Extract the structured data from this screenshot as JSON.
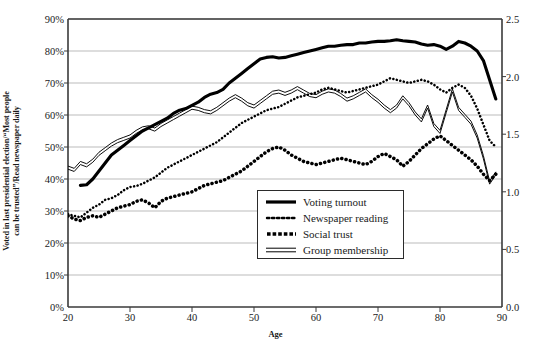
{
  "chart_data": {
    "type": "line",
    "title": "",
    "xlabel": "Age",
    "ylabel": "Voted in last presidential election/“Most people can be trusted”/Read newspaper daily",
    "ylabel_lines": [
      "Voted in last presidential election/“Most people",
      "can be trusted”/Read newspaper daily"
    ],
    "xlim": [
      20,
      90
    ],
    "ylim": [
      0,
      90
    ],
    "y2lim": [
      0.0,
      2.5
    ],
    "xticks": [
      20,
      30,
      40,
      50,
      60,
      70,
      80,
      90
    ],
    "xtick_labels": [
      "20",
      "30",
      "40",
      "50",
      "60",
      "70",
      "80",
      "90"
    ],
    "yticks": [
      0,
      10,
      20,
      30,
      40,
      50,
      60,
      70,
      80,
      90
    ],
    "ytick_labels": [
      "0%",
      "10%",
      "20%",
      "30%",
      "40%",
      "50%",
      "60%",
      "70%",
      "80%",
      "90%"
    ],
    "y2ticks": [
      0.0,
      0.5,
      1.0,
      1.5,
      2.0,
      2.5
    ],
    "y2tick_labels": [
      "0.0",
      "0.5",
      "1.0",
      "1.5",
      "2.0",
      "2.5"
    ],
    "grid": "horizontal",
    "legend_position": "center",
    "x": [
      20,
      21,
      22,
      23,
      24,
      25,
      26,
      27,
      28,
      29,
      30,
      31,
      32,
      33,
      34,
      35,
      36,
      37,
      38,
      39,
      40,
      41,
      42,
      43,
      44,
      45,
      46,
      47,
      48,
      49,
      50,
      51,
      52,
      53,
      54,
      55,
      56,
      57,
      58,
      59,
      60,
      61,
      62,
      63,
      64,
      65,
      66,
      67,
      68,
      69,
      70,
      71,
      72,
      73,
      74,
      75,
      76,
      77,
      78,
      79,
      80,
      81,
      82,
      83,
      84,
      85,
      86,
      87,
      88,
      89
    ],
    "series": [
      {
        "name": "Voting turnout",
        "style": "thick-solid",
        "color": "#000000",
        "axis": "left",
        "values": [
          null,
          null,
          38.0,
          38.2,
          40.0,
          42.5,
          45.0,
          47.5,
          49.0,
          50.5,
          52.0,
          53.5,
          55.0,
          56.0,
          57.0,
          58.0,
          59.0,
          60.5,
          61.5,
          62.0,
          63.0,
          64.0,
          65.5,
          66.5,
          67.0,
          68.0,
          70.0,
          71.5,
          73.0,
          74.5,
          76.0,
          77.5,
          78.0,
          78.2,
          77.8,
          78.0,
          78.5,
          79.0,
          79.5,
          80.0,
          80.5,
          81.0,
          81.5,
          81.5,
          81.8,
          82.0,
          82.0,
          82.5,
          82.5,
          82.8,
          83.0,
          83.0,
          83.2,
          83.5,
          83.2,
          83.0,
          82.8,
          82.2,
          81.8,
          82.0,
          81.5,
          80.5,
          81.5,
          83.0,
          82.5,
          81.5,
          80.0,
          77.0,
          71.0,
          65.0
        ]
      },
      {
        "name": "Newspaper reading",
        "style": "fine-dotted",
        "color": "#000000",
        "axis": "left",
        "values": [
          29.0,
          28.5,
          28.0,
          29.5,
          31.0,
          32.0,
          33.5,
          34.0,
          35.0,
          36.5,
          37.5,
          37.8,
          38.5,
          39.5,
          40.5,
          42.0,
          43.5,
          44.5,
          45.5,
          46.5,
          47.5,
          48.5,
          49.5,
          50.5,
          51.5,
          53.0,
          54.5,
          56.0,
          57.5,
          58.5,
          59.5,
          60.5,
          61.5,
          62.0,
          62.5,
          63.5,
          64.5,
          65.5,
          66.0,
          66.5,
          67.0,
          68.0,
          68.5,
          68.0,
          67.5,
          67.0,
          67.5,
          68.0,
          68.5,
          69.0,
          69.5,
          70.5,
          71.5,
          71.0,
          70.5,
          70.0,
          70.5,
          71.0,
          70.5,
          69.5,
          68.0,
          67.0,
          68.5,
          69.5,
          68.5,
          66.0,
          62.0,
          57.0,
          52.0,
          50.0
        ]
      },
      {
        "name": "Social trust",
        "style": "thick-dotted",
        "color": "#000000",
        "axis": "left",
        "values": [
          28.5,
          27.5,
          27.0,
          28.0,
          28.5,
          28.0,
          29.0,
          30.0,
          31.0,
          31.5,
          32.0,
          33.0,
          33.5,
          32.5,
          31.0,
          33.0,
          34.0,
          34.5,
          35.0,
          35.5,
          36.0,
          37.0,
          38.0,
          38.5,
          39.0,
          39.5,
          40.5,
          41.5,
          42.5,
          44.0,
          45.5,
          47.0,
          48.5,
          49.5,
          50.0,
          49.0,
          47.5,
          46.5,
          45.5,
          45.0,
          44.5,
          45.0,
          45.5,
          46.0,
          46.5,
          46.0,
          45.5,
          45.0,
          44.5,
          45.5,
          47.0,
          48.0,
          47.0,
          46.0,
          44.0,
          45.5,
          47.5,
          49.5,
          51.0,
          52.5,
          53.5,
          52.0,
          50.5,
          49.0,
          47.5,
          46.0,
          44.0,
          41.5,
          39.5,
          41.5
        ]
      },
      {
        "name": "Group membership",
        "style": "double-line",
        "color": "#000000",
        "axis": "right",
        "values": [
          1.21,
          1.19,
          1.25,
          1.23,
          1.27,
          1.33,
          1.37,
          1.41,
          1.44,
          1.46,
          1.48,
          1.52,
          1.55,
          1.56,
          1.54,
          1.58,
          1.61,
          1.64,
          1.67,
          1.7,
          1.73,
          1.72,
          1.7,
          1.69,
          1.72,
          1.76,
          1.8,
          1.83,
          1.8,
          1.76,
          1.74,
          1.78,
          1.82,
          1.86,
          1.87,
          1.85,
          1.87,
          1.9,
          1.87,
          1.84,
          1.83,
          1.86,
          1.88,
          1.87,
          1.84,
          1.8,
          1.82,
          1.85,
          1.88,
          1.83,
          1.79,
          1.74,
          1.7,
          1.74,
          1.82,
          1.76,
          1.68,
          1.62,
          1.74,
          1.58,
          1.52,
          1.7,
          1.88,
          1.72,
          1.66,
          1.6,
          1.48,
          1.3,
          1.08,
          1.16
        ]
      }
    ]
  }
}
